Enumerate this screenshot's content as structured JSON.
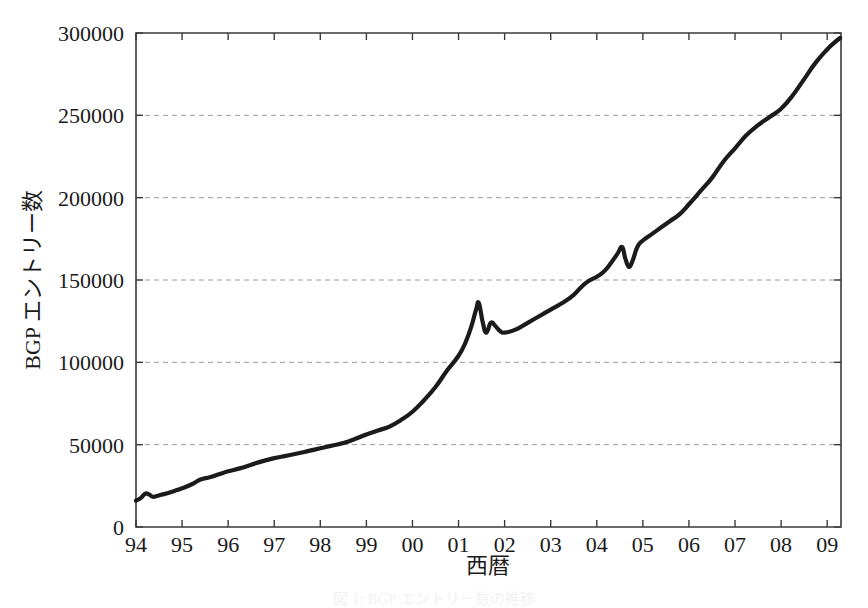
{
  "chart_data": {
    "type": "line",
    "title": "",
    "subtitle": "",
    "xlabel": "西暦",
    "ylabel": "BGP エントリー数",
    "xlim": [
      1994.0,
      2009.3
    ],
    "ylim": [
      0,
      300000
    ],
    "grid": true,
    "legend": null,
    "legend_position": "none",
    "y_ticks": [
      0,
      50000,
      100000,
      150000,
      200000,
      250000,
      300000
    ],
    "y_tick_labels": [
      "0",
      "50000",
      "100000",
      "150000",
      "200000",
      "250000",
      "300000"
    ],
    "x_ticks": [
      1994,
      1995,
      1996,
      1997,
      1998,
      1999,
      2000,
      2001,
      2002,
      2003,
      2004,
      2005,
      2006,
      2007,
      2008,
      2009
    ],
    "x_tick_labels": [
      "94",
      "95",
      "96",
      "97",
      "98",
      "99",
      "00",
      "01",
      "02",
      "03",
      "04",
      "05",
      "06",
      "07",
      "08",
      "09"
    ],
    "series": [
      {
        "name": "BGP エントリー数",
        "color": "#1b1b1b",
        "x": [
          1994.0,
          1994.1,
          1994.2,
          1994.28,
          1994.36,
          1994.45,
          1994.55,
          1994.7,
          1994.85,
          1995.0,
          1995.2,
          1995.4,
          1995.6,
          1995.8,
          1996.0,
          1996.25,
          1996.5,
          1996.75,
          1997.0,
          1997.25,
          1997.5,
          1997.75,
          1998.0,
          1998.25,
          1998.5,
          1998.75,
          1999.0,
          1999.25,
          1999.5,
          1999.75,
          2000.0,
          2000.25,
          2000.5,
          2000.75,
          2001.0,
          2001.15,
          2001.28,
          2001.38,
          2001.44,
          2001.52,
          2001.6,
          2001.7,
          2001.8,
          2001.9,
          2002.0,
          2002.25,
          2002.5,
          2002.75,
          2003.0,
          2003.25,
          2003.5,
          2003.75,
          2004.0,
          2004.15,
          2004.3,
          2004.45,
          2004.55,
          2004.62,
          2004.7,
          2004.78,
          2004.88,
          2005.0,
          2005.2,
          2005.4,
          2005.6,
          2005.8,
          2006.0,
          2006.25,
          2006.5,
          2006.75,
          2007.0,
          2007.25,
          2007.5,
          2007.75,
          2008.0,
          2008.25,
          2008.5,
          2008.75,
          2009.0,
          2009.15,
          2009.28
        ],
        "y": [
          16000,
          17500,
          20200,
          19800,
          18400,
          18800,
          19600,
          20600,
          22000,
          23500,
          25800,
          28800,
          30200,
          32000,
          33800,
          35600,
          37800,
          40000,
          41800,
          43200,
          44600,
          46200,
          47800,
          49400,
          51000,
          53400,
          56200,
          58600,
          61000,
          65000,
          70000,
          77000,
          85000,
          95000,
          104000,
          112000,
          122000,
          132000,
          136000,
          125000,
          118000,
          124000,
          122000,
          119000,
          118000,
          120000,
          124000,
          128000,
          132000,
          136000,
          141000,
          148000,
          152000,
          155000,
          160000,
          166000,
          170000,
          163000,
          158000,
          162000,
          170000,
          174000,
          178000,
          182000,
          186000,
          190000,
          196000,
          204000,
          212000,
          222000,
          230000,
          238000,
          244000,
          249000,
          254000,
          262000,
          272000,
          282000,
          290000,
          294000,
          297000
        ]
      }
    ],
    "annotations": []
  },
  "caption": {
    "text": "図 1: BGP エントリー数の推移"
  }
}
